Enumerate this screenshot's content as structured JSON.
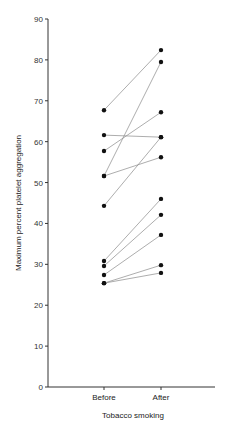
{
  "chart_data": {
    "type": "line",
    "subtype": "paired-dot-plot",
    "title": "",
    "xlabel": "Tobacco smoking",
    "ylabel": "Maximum percent platelet aggregation",
    "categories": [
      "Before",
      "After"
    ],
    "ylim": [
      0,
      90
    ],
    "yticks": [
      0,
      10,
      20,
      30,
      40,
      50,
      60,
      70,
      80,
      90
    ],
    "grid": false,
    "legend": null,
    "series": [
      {
        "name": "subject-1",
        "values": [
          67.7,
          82.4
        ]
      },
      {
        "name": "subject-2",
        "values": [
          61.6,
          61.1
        ]
      },
      {
        "name": "subject-3",
        "values": [
          57.7,
          67.2
        ]
      },
      {
        "name": "subject-4",
        "values": [
          51.6,
          79.5
        ]
      },
      {
        "name": "subject-5",
        "values": [
          51.6,
          56.2
        ]
      },
      {
        "name": "subject-6",
        "values": [
          44.3,
          61.1
        ]
      },
      {
        "name": "subject-7",
        "values": [
          30.8,
          46.0
        ]
      },
      {
        "name": "subject-8",
        "values": [
          29.6,
          42.1
        ]
      },
      {
        "name": "subject-9",
        "values": [
          27.4,
          37.2
        ]
      },
      {
        "name": "subject-10",
        "values": [
          25.4,
          29.8
        ]
      },
      {
        "name": "subject-11",
        "values": [
          25.4,
          27.9
        ]
      }
    ],
    "colors": {
      "line": "#8a8a8a",
      "marker": "#111111",
      "axis": "#333333"
    }
  }
}
